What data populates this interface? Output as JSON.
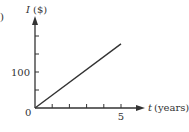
{
  "figure": {
    "part_label": ")"
  },
  "chart_data": {
    "type": "line",
    "title": "",
    "xlabel": "t (years)",
    "ylabel": "I ($)",
    "x_var": "t",
    "x_unit": "(years)",
    "y_var": "I",
    "y_unit": "($)",
    "xlim": [
      0,
      5.5
    ],
    "ylim": [
      0,
      200
    ],
    "x_ticks": [
      1,
      2,
      3,
      4,
      5
    ],
    "x_tick_labels": {
      "5": "5"
    },
    "y_ticks": [
      50,
      100,
      150,
      200
    ],
    "y_tick_labels": {
      "100": "100"
    },
    "origin_label": "0",
    "grid": false,
    "legend": null,
    "series": [
      {
        "name": "I",
        "x": [
          0,
          5
        ],
        "y": [
          0,
          178
        ],
        "color": "#333333"
      }
    ]
  },
  "colors": {
    "axis": "#333333",
    "line": "#333333",
    "background": "#ffffff"
  }
}
